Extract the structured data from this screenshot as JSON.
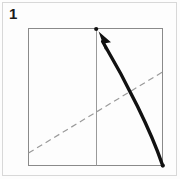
{
  "figure": {
    "step_label": "1",
    "caption": "",
    "kind": "origami-fold-diagram"
  },
  "colors": {
    "outer_frame": "#d8d8d8",
    "paper_fill": "#fdfdfd",
    "paper_edge": "#8a8a8a",
    "crease_vertical": "#9a9a9a",
    "crease_dashed": "#9a9a9a",
    "arrow": "#111111",
    "dot": "#111111",
    "background": "#fdfdfd",
    "label": "#1a1a1a"
  },
  "geometry": {
    "outer_frame": {
      "x": 2,
      "y": 2,
      "width": 175,
      "height": 174
    },
    "paper_square": {
      "x": 28,
      "y": 28,
      "width": 135,
      "height": 138
    },
    "vertical_crease": {
      "x": 96,
      "y1": 28,
      "y2": 166
    },
    "dashed_diagonal": {
      "x1": 28,
      "y1": 153,
      "x2": 163,
      "y2": 72
    },
    "dot_top": {
      "cx": 96,
      "cy": 29,
      "r": 2.1
    },
    "dot_bottom_right": {
      "cx": 163,
      "cy": 166,
      "r": 2.1
    },
    "arc_path": "M 162.5 164.5 C 151 131 128 82 101.5 39",
    "arrow_tip": {
      "x": 99,
      "y": 32
    }
  },
  "annotations": {
    "paper_square_name": "square-paper-sheet",
    "vertical_crease_name": "vertical-crease-line",
    "dashed_diagonal_name": "dashed-crease-line",
    "arrow_name": "fold-motion-arrow",
    "dot_top_name": "target-corner-dot",
    "dot_bottom_name": "source-corner-dot"
  }
}
